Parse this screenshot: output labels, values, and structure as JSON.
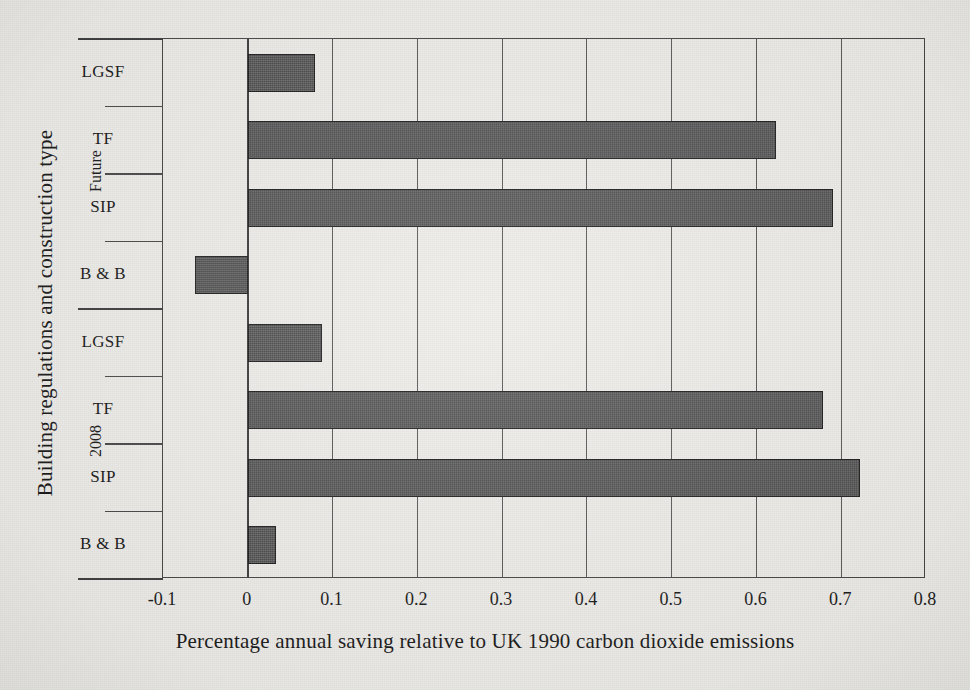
{
  "chart_data": {
    "type": "bar",
    "orientation": "horizontal",
    "title": "",
    "xlabel": "Percentage annual saving relative to UK 1990 carbon dioxide emissions",
    "ylabel": "Building regulations and construction type",
    "xlim": [
      -0.1,
      0.8
    ],
    "ylim": [
      0,
      8
    ],
    "grid": true,
    "legend": "none",
    "xticks": [
      "-0.1",
      "0",
      "0.1",
      "0.2",
      "0.3",
      "0.4",
      "0.5",
      "0.6",
      "0.7",
      "0.8"
    ],
    "xtick_values": [
      -0.1,
      0,
      0.1,
      0.2,
      0.3,
      0.4,
      0.5,
      0.6,
      0.7,
      0.8
    ],
    "groups": [
      {
        "name": "Future",
        "categories": [
          "LGSF",
          "TF",
          "SIP",
          "B & B"
        ],
        "values": [
          0.079,
          0.623,
          0.69,
          -0.062
        ]
      },
      {
        "name": "2008",
        "categories": [
          "LGSF",
          "TF",
          "SIP",
          "B & B"
        ],
        "values": [
          0.087,
          0.678,
          0.722,
          0.033
        ]
      }
    ],
    "categories": [
      "LGSF",
      "TF",
      "SIP",
      "B & B",
      "LGSF",
      "TF",
      "SIP",
      "B & B"
    ],
    "values": [
      0.079,
      0.623,
      0.69,
      -0.062,
      0.087,
      0.678,
      0.722,
      0.033
    ],
    "bar_color": "#575757",
    "bar_edge_color": "#1f1f1f",
    "background_color": "#efeeea"
  },
  "axes": {
    "x_title": "Percentage annual saving relative to UK 1990 carbon dioxide emissions",
    "y_title": "Building regulations and construction type",
    "x_ticks": [
      {
        "label": "-0.1",
        "value": -0.1
      },
      {
        "label": "0",
        "value": 0
      },
      {
        "label": "0.1",
        "value": 0.1
      },
      {
        "label": "0.2",
        "value": 0.2
      },
      {
        "label": "0.3",
        "value": 0.3
      },
      {
        "label": "0.4",
        "value": 0.4
      },
      {
        "label": "0.5",
        "value": 0.5
      },
      {
        "label": "0.6",
        "value": 0.6
      },
      {
        "label": "0.7",
        "value": 0.7
      },
      {
        "label": "0.8",
        "value": 0.8
      }
    ],
    "y_categories": [
      {
        "label": "LGSF",
        "group": "Future",
        "value": 0.079
      },
      {
        "label": "TF",
        "group": "Future",
        "value": 0.623
      },
      {
        "label": "SIP",
        "group": "Future",
        "value": 0.69
      },
      {
        "label": "B & B",
        "group": "Future",
        "value": -0.062
      },
      {
        "label": "LGSF",
        "group": "2008",
        "value": 0.087
      },
      {
        "label": "TF",
        "group": "2008",
        "value": 0.678
      },
      {
        "label": "SIP",
        "group": "2008",
        "value": 0.722
      },
      {
        "label": "B & B",
        "group": "2008",
        "value": 0.033
      }
    ],
    "y_groups": [
      {
        "label": "Future"
      },
      {
        "label": "2008"
      }
    ]
  }
}
